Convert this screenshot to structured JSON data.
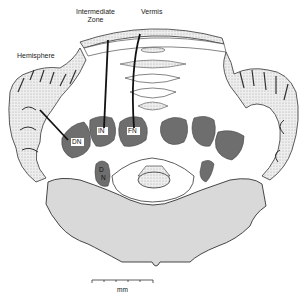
{
  "diagram": {
    "region_labels": {
      "hemisphere": "Hemisphere",
      "intermediate": "Intermediate Zone",
      "intermediate_line1": "Intermediate",
      "intermediate_line2": "Zone",
      "vermis": "Vermis"
    },
    "nuclei": [
      {
        "id": "dn",
        "label": "DN",
        "name": "dentate nucleus"
      },
      {
        "id": "in",
        "label": "IN",
        "name": "interposed nucleus"
      },
      {
        "id": "fn",
        "label": "FN",
        "name": "fastigial nucleus"
      },
      {
        "id": "vn",
        "label_top": "D",
        "label_bottom": "N",
        "name": "vestibular (Deiters) nucleus"
      }
    ],
    "scale_bar": {
      "unit": "mm",
      "ticks": 6
    },
    "colors": {
      "nucleus_fill": "#6e6e6e",
      "brainstem_fill": "#d9d9d9",
      "cortex_fill": "#e2e2e2",
      "outline": "#333333",
      "arrow": "#111111"
    }
  }
}
